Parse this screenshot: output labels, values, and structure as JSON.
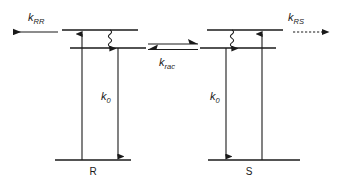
{
  "figure": {
    "type": "energy-level-diagram",
    "background_color": "#ffffff",
    "stroke_color": "#1a1a1a"
  },
  "labels": {
    "k_rr": {
      "symbol": "k",
      "subscript": "RR"
    },
    "k_rs": {
      "symbol": "k",
      "subscript": "RS"
    },
    "k_rac": {
      "symbol": "k",
      "subscript": "rac"
    },
    "k0_left": {
      "symbol": "k",
      "subscript": "0"
    },
    "k0_right": {
      "symbol": "k",
      "subscript": "0"
    },
    "state_left": "R",
    "state_right": "S"
  },
  "left_diagram": {
    "state": "R",
    "levels": [
      {
        "name": "upper-excited-level",
        "y": 30,
        "x1": 62,
        "x2": 138
      },
      {
        "name": "lower-excited-level",
        "y": 48,
        "x1": 70,
        "x2": 146
      },
      {
        "name": "ground-level",
        "y": 160,
        "x1": 55,
        "x2": 131
      }
    ],
    "transitions": [
      {
        "name": "excitation-arrow",
        "direction": "up",
        "x": 82,
        "from_y": 160,
        "to_y": 30
      },
      {
        "name": "internal-conversion-squiggle",
        "direction": "down",
        "x": 110,
        "from_y": 30,
        "to_y": 48
      },
      {
        "name": "emission-arrow-k0",
        "direction": "down",
        "x": 118,
        "from_y": 48,
        "to_y": 160
      }
    ]
  },
  "right_diagram": {
    "state": "S",
    "levels": [
      {
        "name": "upper-excited-level",
        "y": 30,
        "x1": 207,
        "x2": 283
      },
      {
        "name": "lower-excited-level",
        "y": 48,
        "x1": 200,
        "x2": 276
      },
      {
        "name": "ground-level",
        "y": 160,
        "x1": 208,
        "x2": 284
      },
      {
        "name": "ground-level-extension",
        "y": 160,
        "x1": 284,
        "x2": 300
      }
    ],
    "transitions": [
      {
        "name": "internal-conversion-squiggle",
        "direction": "down",
        "x": 232,
        "from_y": 30,
        "to_y": 48
      },
      {
        "name": "emission-arrow-k0",
        "direction": "down",
        "x": 226,
        "from_y": 48,
        "to_y": 160
      },
      {
        "name": "excitation-arrow",
        "direction": "up",
        "x": 262,
        "from_y": 160,
        "to_y": 30
      }
    ]
  },
  "rate_arrows": {
    "left": {
      "name": "k-rr-arrow",
      "direction": "left",
      "style": "solid",
      "x1": 58,
      "x2": 10,
      "y": 32
    },
    "right": {
      "name": "k-rs-arrow",
      "direction": "right",
      "style": "dashed",
      "x1": 293,
      "x2": 333,
      "y": 32
    },
    "equilibrium": {
      "name": "racemization-equilibrium-arrow",
      "forward": {
        "direction": "right",
        "x1": 146,
        "x2": 200,
        "y": 44
      },
      "reverse": {
        "direction": "left",
        "x1": 200,
        "x2": 146,
        "y": 49
      }
    }
  }
}
